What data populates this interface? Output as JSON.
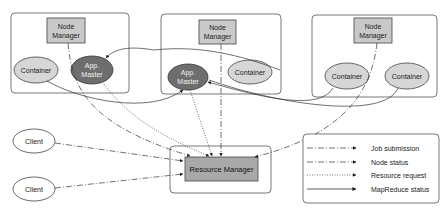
{
  "diagram": {
    "nodes": [
      {
        "id": "node1",
        "node_manager": {
          "line1": "Node",
          "line2": "Manager"
        },
        "container": "Container",
        "app_master": {
          "line1": "App.",
          "line2": "Master"
        }
      },
      {
        "id": "node2",
        "node_manager": {
          "line1": "Node",
          "line2": "Manager"
        },
        "app_master": {
          "line1": "App.",
          "line2": "Master"
        },
        "container": "Container"
      },
      {
        "id": "node3",
        "node_manager": {
          "line1": "Node",
          "line2": "Manager"
        },
        "container_a": "Container",
        "container_b": "Container"
      }
    ],
    "clients": [
      "Client",
      "Client"
    ],
    "resource_manager": "Resource Manager",
    "legend": [
      {
        "label": "Job submission",
        "style": "dash-dot"
      },
      {
        "label": "Node status",
        "style": "dash-dot"
      },
      {
        "label": "Resource request",
        "style": "dotted"
      },
      {
        "label": "MapReduce status",
        "style": "solid"
      }
    ],
    "colors": {
      "node_manager_fill": "#c9c9c9",
      "container_fill": "#d6d6d6",
      "app_master_fill": "#6e6e6e",
      "resource_manager_fill": "#a9a9a9",
      "stroke": "#333333",
      "frame": "#555555"
    }
  }
}
